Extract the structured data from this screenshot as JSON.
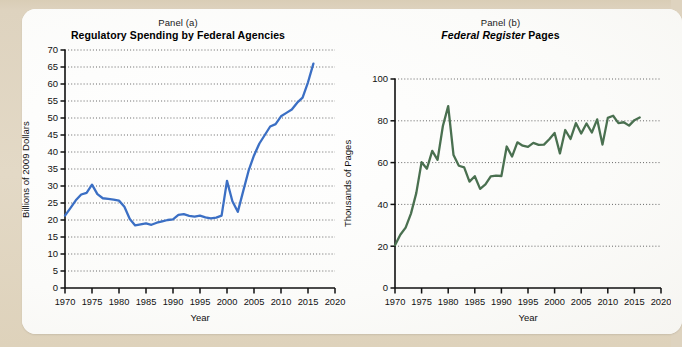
{
  "figure": {
    "background_color": "#e0d5c0",
    "card_color": "#fdfdfb"
  },
  "panel_a": {
    "label": "Panel (a)",
    "title": "Regulatory Spending by Federal Agencies",
    "xlabel": "Year",
    "ylabel": "Billions of 2009 Dollars",
    "line_color": "#3b6fc4"
  },
  "panel_b": {
    "label": "Panel (b)",
    "title_italic": "Federal Register",
    "title_rest": " Pages",
    "xlabel": "Year",
    "ylabel": "Thousands of Pages",
    "line_color": "#4a7050"
  },
  "chart_data": [
    {
      "type": "line",
      "id": "panel-a",
      "title": "Regulatory Spending by Federal Agencies",
      "subtitle": "Panel (a)",
      "xlabel": "Year",
      "ylabel": "Billions of 2009 Dollars",
      "xlim": [
        1970,
        2020
      ],
      "ylim": [
        0,
        70
      ],
      "xticks": [
        1970,
        1975,
        1980,
        1985,
        1990,
        1995,
        2000,
        2005,
        2010,
        2015,
        2020
      ],
      "yticks": [
        0,
        5,
        10,
        15,
        20,
        25,
        30,
        35,
        40,
        45,
        50,
        55,
        60,
        65,
        70
      ],
      "grid": "horizontal-dotted",
      "legend": "none",
      "color": "#3b6fc4",
      "series": [
        {
          "name": "Regulatory spending (billions of 2009 dollars)",
          "x": [
            1970,
            1971,
            1972,
            1973,
            1974,
            1975,
            1976,
            1977,
            1978,
            1979,
            1980,
            1981,
            1982,
            1983,
            1984,
            1985,
            1986,
            1987,
            1988,
            1989,
            1990,
            1991,
            1992,
            1993,
            1994,
            1995,
            1996,
            1997,
            1998,
            1999,
            2000,
            2001,
            2002,
            2003,
            2004,
            2005,
            2006,
            2007,
            2008,
            2009,
            2010,
            2011,
            2012,
            2013,
            2014,
            2015,
            2016
          ],
          "values": [
            21.3,
            23.5,
            25.8,
            27.5,
            28.0,
            30.4,
            27.6,
            26.4,
            26.2,
            26.0,
            25.7,
            23.9,
            20.3,
            18.4,
            18.7,
            19.0,
            18.6,
            19.2,
            19.6,
            20.0,
            20.2,
            21.5,
            21.7,
            21.2,
            21.0,
            21.3,
            20.8,
            20.5,
            20.7,
            21.3,
            31.5,
            25.5,
            22.4,
            28.5,
            34.5,
            39.0,
            42.5,
            45.0,
            47.5,
            48.2,
            50.5,
            51.5,
            52.5,
            54.5,
            56.0,
            60.5,
            66.0
          ]
        }
      ]
    },
    {
      "type": "line",
      "id": "panel-b",
      "title": "Federal Register Pages",
      "subtitle": "Panel (b)",
      "xlabel": "Year",
      "ylabel": "Thousands of Pages",
      "xlim": [
        1970,
        2020
      ],
      "ylim": [
        0,
        100
      ],
      "xticks": [
        1970,
        1975,
        1980,
        1985,
        1990,
        1995,
        2000,
        2005,
        2010,
        2015,
        2020
      ],
      "yticks": [
        0,
        20,
        40,
        60,
        80,
        100
      ],
      "grid": "horizontal-dotted",
      "legend": "none",
      "color": "#4a7050",
      "series": [
        {
          "name": "Federal Register pages (thousands)",
          "x": [
            1970,
            1971,
            1972,
            1973,
            1974,
            1975,
            1976,
            1977,
            1978,
            1979,
            1980,
            1981,
            1982,
            1983,
            1984,
            1985,
            1986,
            1987,
            1988,
            1989,
            1990,
            1991,
            1992,
            1993,
            1994,
            1995,
            1996,
            1997,
            1998,
            1999,
            2000,
            2001,
            2002,
            2003,
            2004,
            2005,
            2006,
            2007,
            2008,
            2009,
            2010,
            2011,
            2012,
            2013,
            2014,
            2015,
            2016
          ],
          "values": [
            20.5,
            25.5,
            28.9,
            35.6,
            45.4,
            60.2,
            57.1,
            65.6,
            61.3,
            77.5,
            87.0,
            63.6,
            58.5,
            57.7,
            50.9,
            53.5,
            47.4,
            49.6,
            53.4,
            53.8,
            53.6,
            67.7,
            62.9,
            69.7,
            68.1,
            67.5,
            69.4,
            68.5,
            68.6,
            71.2,
            74.2,
            64.4,
            75.6,
            71.3,
            78.9,
            73.9,
            78.7,
            74.4,
            80.7,
            68.6,
            81.4,
            82.4,
            78.9,
            79.3,
            77.7,
            80.3,
            81.6
          ]
        }
      ]
    }
  ]
}
